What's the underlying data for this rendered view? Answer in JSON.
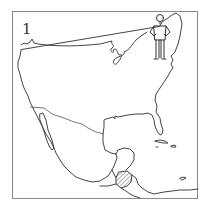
{
  "panel": {
    "number": "1"
  },
  "map": {
    "subject": "North America outline map",
    "regions": [
      "United States",
      "Mexico",
      "Central America",
      "Caribbean islands"
    ],
    "highlighted_region": "Guatemala",
    "highlight_style": "hatched"
  },
  "colors": {
    "line": "#444444",
    "frame": "#8a8a8a",
    "background": "#ffffff",
    "hatch": "#666666"
  }
}
